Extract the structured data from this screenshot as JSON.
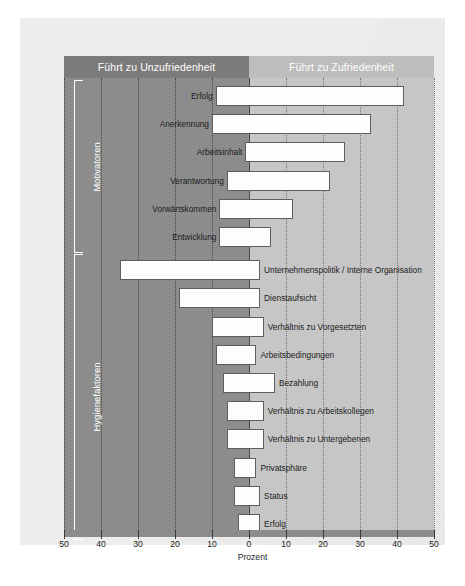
{
  "figure": {
    "axis_title": "Prozent",
    "header_left": "Führt zu Unzufriedenheit",
    "header_right": "Führt zu Zufriedenheit",
    "group_motivators": "Motivatoren",
    "group_hygiene": "Hygienefaktoren"
  },
  "colors": {
    "band_left": "#8c8c8c",
    "band_right": "#c6c6c6",
    "header_left": "#7b7b7b",
    "header_right": "#bdbdbd",
    "bar_fill": "#fdfdfd",
    "bar_stroke": "#5e5e5e",
    "card": "#ececec"
  },
  "chart_data": {
    "type": "bar",
    "orientation": "horizontal",
    "title": "",
    "subtitle": "",
    "xlabel": "Prozent",
    "ylabel": "",
    "xlim": [
      -50,
      50
    ],
    "xticks": [
      50,
      40,
      30,
      20,
      10,
      0,
      10,
      20,
      30,
      40,
      50
    ],
    "xtick_signed": [
      -50,
      -40,
      -30,
      -20,
      -10,
      0,
      10,
      20,
      30,
      40,
      50
    ],
    "grid": true,
    "legend": "none",
    "annotations": [
      "Führt zu Unzufriedenheit",
      "Führt zu Zufriedenheit",
      "Motivatoren",
      "Hygienefaktoren"
    ],
    "groups": [
      {
        "name": "Motivatoren",
        "items": [
          {
            "label": "Erfolg",
            "left": 9,
            "right": 42
          },
          {
            "label": "Anerkennung",
            "left": 10,
            "right": 33
          },
          {
            "label": "Arbeitsinhalt",
            "left": 1,
            "right": 26
          },
          {
            "label": "Verantwortung",
            "left": 6,
            "right": 22
          },
          {
            "label": "Vorwärtskommen",
            "left": 8,
            "right": 12
          },
          {
            "label": "Entwicklung",
            "left": 8,
            "right": 6
          }
        ]
      },
      {
        "name": "Hygienefaktoren",
        "items": [
          {
            "label": "Unternehmenspolitik / Interne Organisation",
            "left": 35,
            "right": 3
          },
          {
            "label": "Dienstaufsicht",
            "left": 19,
            "right": 3
          },
          {
            "label": "Verhältnis zu Vorgesetzten",
            "left": 10,
            "right": 4
          },
          {
            "label": "Arbeitsbedingungen",
            "left": 9,
            "right": 2
          },
          {
            "label": "Bezahlung",
            "left": 7,
            "right": 7
          },
          {
            "label": "Verhältnis zu Arbeitskollegen",
            "left": 6,
            "right": 4
          },
          {
            "label": "Verhältnis zu Untergebenen",
            "left": 6,
            "right": 4
          },
          {
            "label": "Privatsphäre",
            "left": 4,
            "right": 2
          },
          {
            "label": "Status",
            "left": 4,
            "right": 3
          },
          {
            "label": "Erfolg",
            "left": 3,
            "right": 3
          }
        ]
      }
    ]
  }
}
